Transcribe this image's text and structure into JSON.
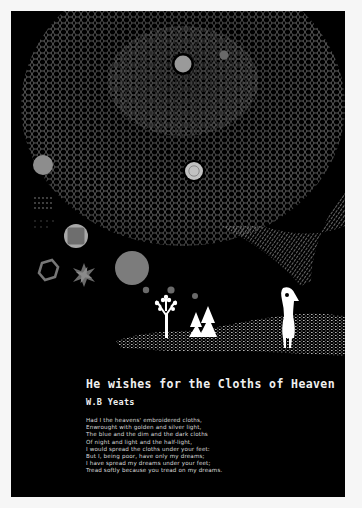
{
  "poster": {
    "background_color": "#000000",
    "margin_color": "#f6f6f6",
    "illustration": {
      "description": "Starry net-like celestial sphere above a figure, trees and hills",
      "elements": [
        {
          "name": "large-planet-top",
          "color": "#9a9a9a"
        },
        {
          "name": "small-planet-top",
          "color": "#6a6a6a"
        },
        {
          "name": "ringed-planet-center",
          "color": "#bdbdbd"
        },
        {
          "name": "grey-disc-left",
          "color": "#8d8d8d"
        },
        {
          "name": "square-in-circle",
          "color": "#6e6e6e"
        },
        {
          "name": "hexagon-ring",
          "color": "#777777"
        },
        {
          "name": "star-flower",
          "color": "#6b6b6b"
        },
        {
          "name": "large-grey-moon",
          "color": "#7c7c7c"
        },
        {
          "name": "white-tree",
          "color": "#ffffff"
        },
        {
          "name": "pine-trees",
          "color": "#ffffff"
        },
        {
          "name": "standing-figure",
          "color": "#ffffff"
        }
      ]
    },
    "title": "He wishes for the Cloths of Heaven",
    "author": "W.B Yeats",
    "poem_lines": [
      "Had I the heavens' embroidered cloths,",
      "Enwrought with golden and silver light,",
      "The blue and the dim and the dark cloths",
      "Of night and light and the half-light,",
      "I would spread the cloths under your feet:",
      "But I, being poor, have only my dreams;",
      "I have spread my dreams under your feet;",
      "Tread softly because you tread on my dreams."
    ]
  }
}
